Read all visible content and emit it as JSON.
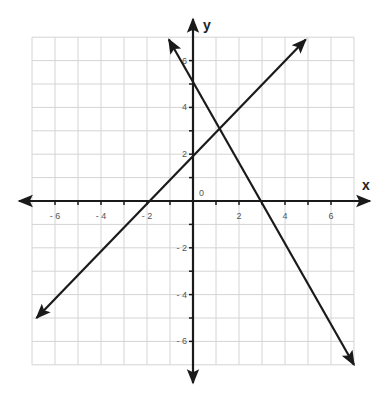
{
  "chart_data": {
    "type": "line",
    "title": "",
    "xlabel": "x",
    "ylabel": "y",
    "xlim": [
      -7,
      7
    ],
    "ylim": [
      -7,
      7
    ],
    "grid": true,
    "origin_label": "0",
    "x_ticks": [
      -6,
      -4,
      -2,
      2,
      4,
      6
    ],
    "x_tick_labels": [
      "- 6",
      "- 4",
      "- 2",
      "2",
      "4",
      "6"
    ],
    "y_ticks": [
      -6,
      -4,
      -2,
      2,
      4,
      6
    ],
    "y_tick_labels": [
      "- 6",
      "- 4",
      "- 2",
      "2",
      "4",
      "6"
    ],
    "series": [
      {
        "name": "line-increasing",
        "equation": "y = x + 2",
        "slope": 1,
        "intercept": 2,
        "x_intercept": -2,
        "points": [
          [
            -6.8,
            -5.0
          ],
          [
            4.9,
            6.9
          ]
        ],
        "arrows": "both"
      },
      {
        "name": "line-decreasing",
        "equation": "y = -1.75x + 5.25",
        "slope": -1.75,
        "intercept": 5.25,
        "x_intercept": 3,
        "points": [
          [
            -1.05,
            6.9
          ],
          [
            7.0,
            -7.0
          ]
        ],
        "arrows": "both"
      }
    ],
    "intersection": [
      1.2,
      3.2
    ]
  },
  "colors": {
    "grid": "#d4d4d4",
    "axis": "#1a1a1a",
    "line": "#1a1a1a",
    "tick_label": "#555555"
  }
}
